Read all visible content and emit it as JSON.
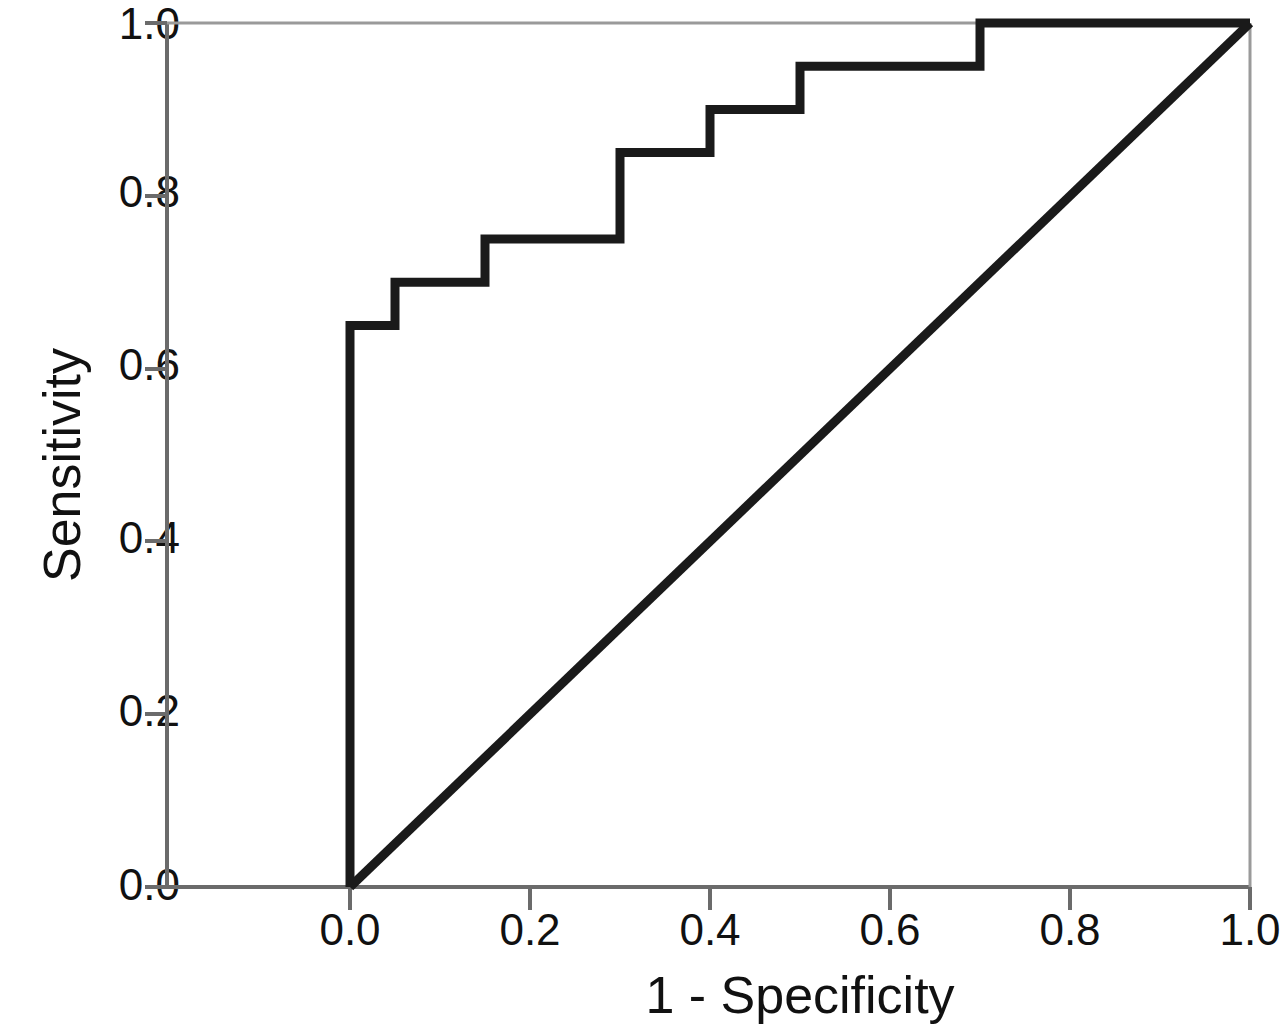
{
  "chart_data": {
    "type": "line",
    "title": "",
    "subtitle": "",
    "xlabel": "1 - Specificity",
    "ylabel": "Sensitivity",
    "xlim": [
      0.0,
      1.0
    ],
    "ylim": [
      0.0,
      1.0
    ],
    "grid": false,
    "legend": null,
    "legend_position": "none",
    "x_ticks": [
      0.0,
      0.2,
      0.4,
      0.6,
      0.8,
      1.0
    ],
    "y_ticks": [
      0.0,
      0.2,
      0.4,
      0.6,
      0.8,
      1.0
    ],
    "x_tick_labels": [
      "0.0",
      "0.2",
      "0.4",
      "0.6",
      "0.8",
      "1.0"
    ],
    "y_tick_labels": [
      "0.0",
      "0.2",
      "0.4",
      "0.6",
      "0.8",
      "1.0"
    ],
    "series": [
      {
        "name": "ROC curve",
        "style": "step",
        "color": "#1a1a1a",
        "line_width": 9,
        "x": [
          0.0,
          0.0,
          0.05,
          0.05,
          0.15,
          0.15,
          0.3,
          0.3,
          0.4,
          0.4,
          0.5,
          0.5,
          0.7,
          0.7,
          1.0
        ],
        "y": [
          0.0,
          0.65,
          0.65,
          0.7,
          0.7,
          0.75,
          0.75,
          0.85,
          0.85,
          0.9,
          0.9,
          0.95,
          0.95,
          1.0,
          1.0
        ]
      },
      {
        "name": "Reference line",
        "style": "diagonal",
        "color": "#1a1a1a",
        "line_width": 9,
        "x": [
          0.0,
          1.0
        ],
        "y": [
          0.0,
          1.0
        ]
      }
    ]
  },
  "axes": {
    "y_title": "Sensitivity",
    "x_title": "1 - Specificity",
    "y_tick_0": "0.0",
    "y_tick_1": "0.2",
    "y_tick_2": "0.4",
    "y_tick_3": "0.6",
    "y_tick_4": "0.8",
    "y_tick_5": "1.0",
    "x_tick_0": "0.0",
    "x_tick_1": "0.2",
    "x_tick_2": "0.4",
    "x_tick_3": "0.6",
    "x_tick_4": "0.8",
    "x_tick_5": "1.0"
  },
  "colors": {
    "curve": "#1a1a1a",
    "axis": "#6b6b6b",
    "background": "#ffffff",
    "text": "#111111"
  }
}
